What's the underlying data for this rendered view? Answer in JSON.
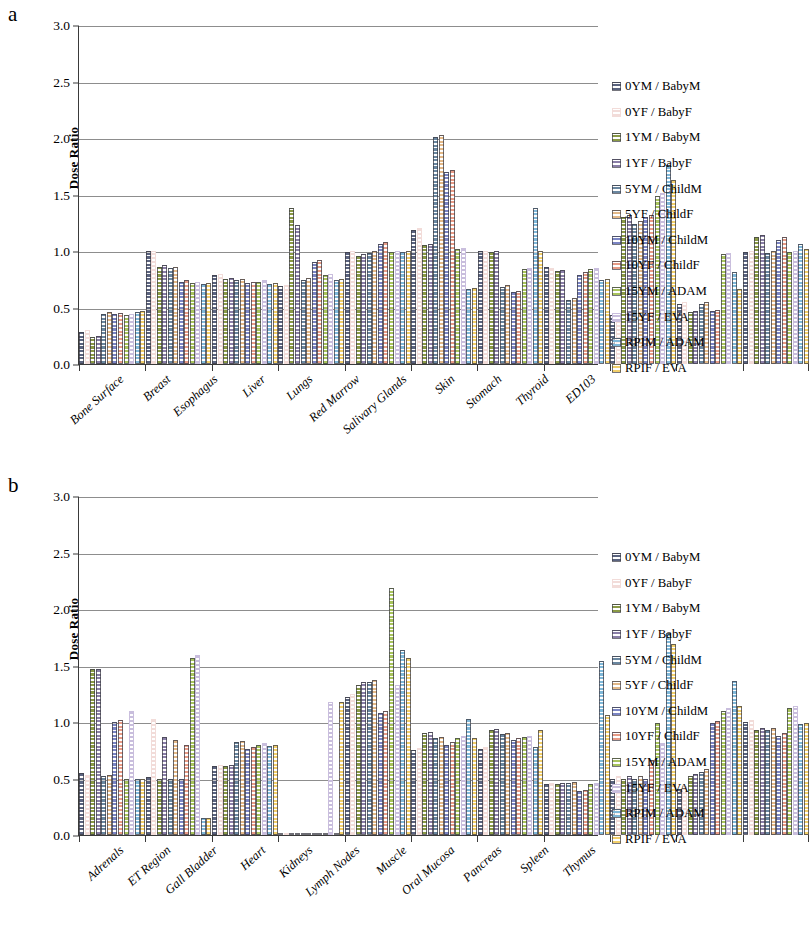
{
  "figure": {
    "panels": [
      {
        "letter": "a"
      },
      {
        "letter": "b"
      }
    ]
  },
  "axis": {
    "ylabel": "Dose Ratio",
    "yticks": [
      "0.0",
      "0.5",
      "1.0",
      "1.5",
      "2.0",
      "2.5",
      "3.0"
    ]
  },
  "legend": {
    "items": [
      {
        "label": "0YM / BabyM",
        "color": "#5b6480",
        "pattern": "solid"
      },
      {
        "label": "0YF / BabyF",
        "color": "#f2dcd9",
        "pattern": "outline"
      },
      {
        "label": "1YM / BabyM",
        "color": "#8a9a45",
        "pattern": "solid"
      },
      {
        "label": "1YF / BabyF",
        "color": "#8b7fa8",
        "pattern": "dots"
      },
      {
        "label": "5YM / ChildM",
        "color": "#6a87a0",
        "pattern": "solid"
      },
      {
        "label": "5YF / ChildF",
        "color": "#e3b887",
        "pattern": "diag"
      },
      {
        "label": "10YM / ChildM",
        "color": "#7b85c4",
        "pattern": "solid"
      },
      {
        "label": "10YF / ChildF",
        "color": "#e89b86",
        "pattern": "diag"
      },
      {
        "label": "15YM / ADAM",
        "color": "#a8c45c",
        "pattern": "solid"
      },
      {
        "label": "15YF / EVA",
        "color": "#c9bedd",
        "pattern": "outline"
      },
      {
        "label": "RPIM / ADAM",
        "color": "#7fb8d9",
        "pattern": "solid"
      },
      {
        "label": "RPIF / EVA",
        "color": "#f2cf6a",
        "pattern": "dots"
      }
    ]
  },
  "chart_data": [
    {
      "type": "bar",
      "panel": "a",
      "title": "",
      "xlabel": "",
      "ylabel": "Dose Ratio",
      "ylim": [
        0,
        3.0
      ],
      "ytick_step": 0.5,
      "grid": true,
      "legend_position": "right",
      "categories": [
        "Bone Surface",
        "Breast",
        "Esophagus",
        "Liver",
        "Lungs",
        "Red Marrow",
        "Salivary Glands",
        "Skin",
        "Stomach",
        "Thyroid",
        "ED103"
      ],
      "series": [
        {
          "name": "0YM / BabyM",
          "values": [
            0.28,
            1.0,
            0.79,
            0.69,
            0.99,
            1.19,
            1.0,
            0.86,
            0.43,
            0.53,
            0.99
          ]
        },
        {
          "name": "0YF / BabyF",
          "values": [
            0.3,
            1.0,
            0.8,
            0.7,
            1.0,
            1.2,
            1.0,
            0.85,
            0.45,
            0.55,
            1.0
          ]
        },
        {
          "name": "1YM / BabyM",
          "values": [
            0.24,
            0.86,
            0.75,
            1.38,
            0.96,
            1.05,
            0.99,
            0.82,
            1.3,
            0.46,
            1.12
          ]
        },
        {
          "name": "1YF / BabyF",
          "values": [
            0.25,
            0.88,
            0.76,
            1.23,
            0.97,
            1.06,
            1.0,
            0.83,
            1.32,
            0.47,
            1.14
          ]
        },
        {
          "name": "5YM / ChildM",
          "values": [
            0.44,
            0.85,
            0.74,
            0.74,
            0.98,
            2.01,
            0.68,
            0.57,
            1.24,
            0.53,
            0.98
          ]
        },
        {
          "name": "5YF / ChildF",
          "values": [
            0.46,
            0.86,
            0.75,
            0.76,
            1.0,
            2.03,
            0.7,
            0.58,
            1.27,
            0.55,
            1.0
          ]
        },
        {
          "name": "10YM / ChildM",
          "values": [
            0.44,
            0.73,
            0.72,
            0.9,
            1.06,
            1.7,
            0.64,
            0.79,
            1.3,
            0.47,
            1.1
          ]
        },
        {
          "name": "10YF / ChildF",
          "values": [
            0.45,
            0.74,
            0.73,
            0.92,
            1.08,
            1.72,
            0.65,
            0.81,
            1.32,
            0.48,
            1.12
          ]
        },
        {
          "name": "15YM / ADAM",
          "values": [
            0.43,
            0.72,
            0.73,
            0.79,
            0.99,
            1.02,
            0.84,
            0.84,
            1.49,
            0.97,
            0.99
          ]
        },
        {
          "name": "15YF / EVA",
          "values": [
            0.44,
            0.73,
            0.74,
            0.8,
            1.0,
            1.03,
            0.85,
            0.85,
            1.51,
            0.98,
            1.0
          ]
        },
        {
          "name": "RPIM / ADAM",
          "values": [
            0.46,
            0.71,
            0.71,
            0.74,
            0.99,
            0.66,
            1.38,
            0.74,
            1.76,
            0.81,
            1.06
          ]
        },
        {
          "name": "RPIF / EVA",
          "values": [
            0.47,
            0.72,
            0.72,
            0.75,
            1.0,
            0.67,
            1.0,
            0.75,
            1.63,
            0.66,
            1.02
          ]
        }
      ]
    },
    {
      "type": "bar",
      "panel": "b",
      "title": "",
      "xlabel": "",
      "ylabel": "Dose Ratio",
      "ylim": [
        0,
        3.0
      ],
      "ytick_step": 0.5,
      "grid": true,
      "legend_position": "right",
      "categories": [
        "Adrenals",
        "ET Region",
        "Gall Bladder",
        "Heart",
        "Kidneys",
        "Lymph Nodes",
        "Muscle",
        "Oral Mucosa",
        "Pancreas",
        "Spleen",
        "Thymus"
      ],
      "series": [
        {
          "name": "0YM / BabyM",
          "values": [
            0.55,
            0.51,
            0.61,
            0.0,
            1.22,
            0.75,
            0.76,
            0.45,
            0.5,
            0.41,
            1.0
          ]
        },
        {
          "name": "0YF / BabyF",
          "values": [
            0.53,
            1.03,
            0.62,
            0.0,
            1.25,
            0.77,
            0.78,
            0.46,
            0.52,
            0.43,
            1.02
          ]
        },
        {
          "name": "1YM / BabyM",
          "values": [
            1.47,
            0.5,
            0.61,
            0.0,
            1.33,
            0.9,
            0.93,
            0.45,
            0.5,
            0.52,
            0.93
          ]
        },
        {
          "name": "1YF / BabyF",
          "values": [
            1.47,
            0.87,
            0.62,
            0.0,
            1.35,
            0.91,
            0.94,
            0.46,
            0.52,
            0.54,
            0.95
          ]
        },
        {
          "name": "5YM / ChildM",
          "values": [
            0.52,
            0.5,
            0.82,
            0.0,
            1.35,
            0.86,
            0.89,
            0.46,
            0.5,
            0.56,
            0.93
          ]
        },
        {
          "name": "5YF / ChildF",
          "values": [
            0.53,
            0.84,
            0.83,
            0.0,
            1.37,
            0.87,
            0.9,
            0.47,
            0.52,
            0.58,
            0.95
          ]
        },
        {
          "name": "10YM / ChildM",
          "values": [
            1.0,
            0.5,
            0.76,
            0.0,
            1.08,
            0.8,
            0.84,
            0.39,
            0.5,
            0.99,
            0.88
          ]
        },
        {
          "name": "10YF / ChildF",
          "values": [
            1.02,
            0.8,
            0.78,
            0.0,
            1.1,
            0.82,
            0.86,
            0.4,
            0.66,
            1.01,
            0.9
          ]
        },
        {
          "name": "15YM / ADAM",
          "values": [
            0.5,
            1.57,
            0.8,
            0.0,
            2.19,
            0.86,
            0.87,
            0.45,
            0.99,
            1.1,
            1.12
          ]
        },
        {
          "name": "15YF / EVA",
          "values": [
            1.1,
            1.59,
            0.81,
            1.18,
            1.33,
            0.88,
            0.88,
            0.46,
            0.81,
            1.12,
            1.14
          ]
        },
        {
          "name": "RPIM / ADAM",
          "values": [
            0.5,
            0.15,
            0.79,
            0.0,
            1.64,
            1.03,
            0.78,
            1.54,
            1.79,
            1.36,
            0.98
          ]
        },
        {
          "name": "RPIF / EVA",
          "values": [
            0.5,
            0.15,
            0.8,
            1.18,
            1.57,
            0.86,
            0.93,
            1.06,
            1.69,
            1.14,
            0.99
          ]
        }
      ]
    }
  ]
}
